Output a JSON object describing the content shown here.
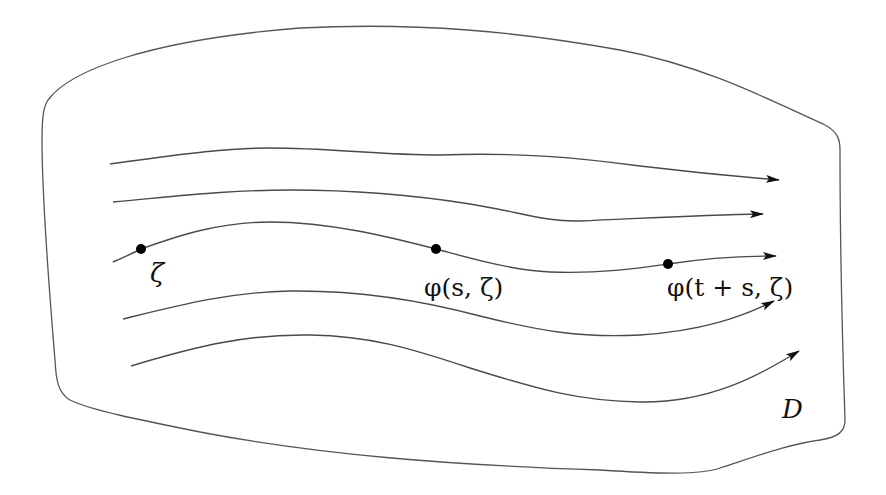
{
  "diagram": {
    "region_label": "D",
    "points": [
      {
        "label": "ζ",
        "x": 141,
        "y": 249
      },
      {
        "label": "φ(s, ζ)",
        "x": 436,
        "y": 249
      },
      {
        "label": "φ(t + s, ζ)",
        "x": 668,
        "y": 264
      }
    ],
    "labels": {
      "zeta": "ζ",
      "phi_s": "φ(s, ζ)",
      "phi_ts": "φ(t + s, ζ)",
      "domain": "D"
    },
    "flow_lines": [
      {
        "id": "flow-1",
        "arrow": true
      },
      {
        "id": "flow-2",
        "arrow": true
      },
      {
        "id": "flow-3",
        "arrow": true,
        "has_points": true
      },
      {
        "id": "flow-4",
        "arrow": true
      },
      {
        "id": "flow-5",
        "arrow": true
      }
    ],
    "colors": {
      "stroke": "#4a4a4a",
      "boundary": "#555555",
      "point": "#000000",
      "background": "#ffffff"
    }
  }
}
